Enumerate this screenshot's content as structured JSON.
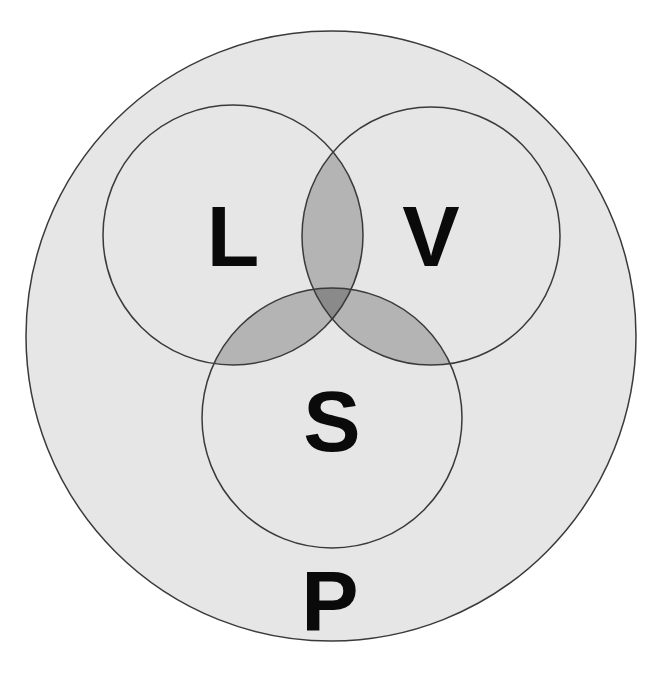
{
  "diagram": {
    "type": "venn",
    "outer_set": {
      "label": "P",
      "center": [
        331,
        336
      ],
      "radius": 305
    },
    "sets": [
      {
        "id": "L",
        "label": "L",
        "center": [
          233,
          235
        ],
        "radius": 130
      },
      {
        "id": "V",
        "label": "V",
        "center": [
          431,
          236
        ],
        "radius": 129
      },
      {
        "id": "S",
        "label": "S",
        "center": [
          332,
          418
        ],
        "radius": 130
      }
    ],
    "labels": {
      "L": "L",
      "V": "V",
      "S": "S",
      "P": "P"
    },
    "colors": {
      "background": "#ffffff",
      "outer_fill": "#e6e6e6",
      "pair_overlap_fill": "#b4b4b4",
      "triple_overlap_fill": "#8a8a8a",
      "stroke": "#3a3a3a",
      "text": "#0a0a0a"
    }
  }
}
